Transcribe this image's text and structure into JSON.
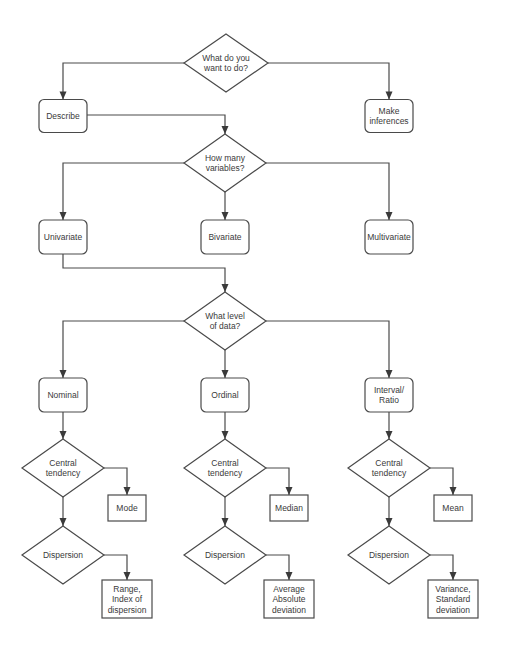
{
  "diagram": {
    "type": "flowchart",
    "nodes": {
      "q_want": {
        "shape": "decision",
        "lines": [
          "What do you",
          "want to do?"
        ]
      },
      "describe": {
        "shape": "process-rounded",
        "lines": [
          "Describe"
        ]
      },
      "inferences": {
        "shape": "process-rounded",
        "lines": [
          "Make",
          "inferences"
        ]
      },
      "q_vars": {
        "shape": "decision",
        "lines": [
          "How many",
          "variables?"
        ]
      },
      "univariate": {
        "shape": "process-rounded",
        "lines": [
          "Univariate"
        ]
      },
      "bivariate": {
        "shape": "process-rounded",
        "lines": [
          "Bivariate"
        ]
      },
      "multivariate": {
        "shape": "process-rounded",
        "lines": [
          "Multivariate"
        ]
      },
      "q_level": {
        "shape": "decision",
        "lines": [
          "What level",
          "of data?"
        ]
      },
      "nominal": {
        "shape": "process-rounded",
        "lines": [
          "Nominal"
        ]
      },
      "ordinal": {
        "shape": "process-rounded",
        "lines": [
          "Ordinal"
        ]
      },
      "interval": {
        "shape": "process-rounded",
        "lines": [
          "Interval/",
          "Ratio"
        ]
      },
      "nom_ct": {
        "shape": "decision",
        "lines": [
          "Central",
          "tendency"
        ]
      },
      "ord_ct": {
        "shape": "decision",
        "lines": [
          "Central",
          "tendency"
        ]
      },
      "int_ct": {
        "shape": "decision",
        "lines": [
          "Central",
          "tendency"
        ]
      },
      "mode": {
        "shape": "terminal-square",
        "lines": [
          "Mode"
        ]
      },
      "median": {
        "shape": "terminal-square",
        "lines": [
          "Median"
        ]
      },
      "mean": {
        "shape": "terminal-square",
        "lines": [
          "Mean"
        ]
      },
      "nom_disp": {
        "shape": "decision",
        "lines": [
          "Dispersion"
        ]
      },
      "ord_disp": {
        "shape": "decision",
        "lines": [
          "Dispersion"
        ]
      },
      "int_disp": {
        "shape": "decision",
        "lines": [
          "Dispersion"
        ]
      },
      "range": {
        "shape": "terminal-square",
        "lines": [
          "Range,",
          "Index of",
          "dispersion"
        ]
      },
      "avgdev": {
        "shape": "terminal-square",
        "lines": [
          "Average",
          "Absolute",
          "deviation"
        ]
      },
      "variance": {
        "shape": "terminal-square",
        "lines": [
          "Variance,",
          "Standard",
          "deviation"
        ]
      }
    },
    "edges": [
      [
        "q_want",
        "describe"
      ],
      [
        "q_want",
        "inferences"
      ],
      [
        "describe",
        "q_vars"
      ],
      [
        "q_vars",
        "univariate"
      ],
      [
        "q_vars",
        "bivariate"
      ],
      [
        "q_vars",
        "multivariate"
      ],
      [
        "univariate",
        "q_level"
      ],
      [
        "q_level",
        "nominal"
      ],
      [
        "q_level",
        "ordinal"
      ],
      [
        "q_level",
        "interval"
      ],
      [
        "nominal",
        "nom_ct"
      ],
      [
        "ordinal",
        "ord_ct"
      ],
      [
        "interval",
        "int_ct"
      ],
      [
        "nom_ct",
        "mode"
      ],
      [
        "ord_ct",
        "median"
      ],
      [
        "int_ct",
        "mean"
      ],
      [
        "nom_ct",
        "nom_disp"
      ],
      [
        "ord_ct",
        "ord_disp"
      ],
      [
        "int_ct",
        "int_disp"
      ],
      [
        "nom_disp",
        "range"
      ],
      [
        "ord_disp",
        "avgdev"
      ],
      [
        "int_disp",
        "variance"
      ]
    ],
    "colors": {
      "stroke": "#4a4a4a",
      "text": "#3a3a3a",
      "background": "#ffffff"
    }
  }
}
